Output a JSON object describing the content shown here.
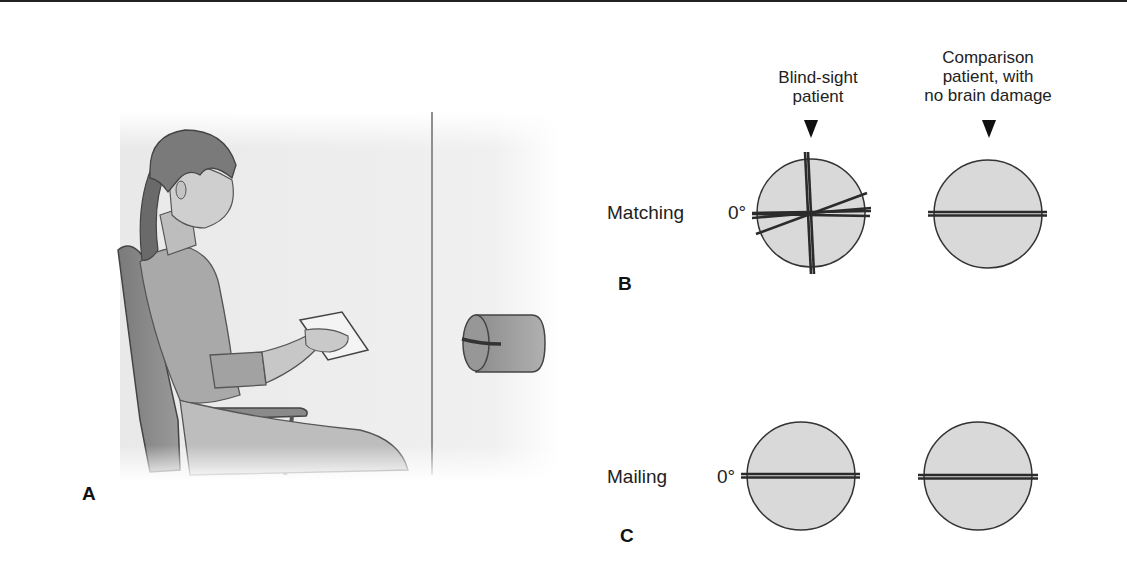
{
  "figure": {
    "panels": {
      "a": {
        "letter": "A"
      },
      "b": {
        "letter": "B",
        "row_label": "Matching",
        "zero_label": "0°"
      },
      "c": {
        "letter": "C",
        "row_label": "Mailing",
        "zero_label": "0°"
      }
    },
    "columns": [
      {
        "heading_line1": "Blind-sight",
        "heading_line2": "patient",
        "heading_line3": ""
      },
      {
        "heading_line1": "Comparison",
        "heading_line2": "patient, with",
        "heading_line3": "no brain damage"
      }
    ],
    "orientation_results": {
      "matching_blindsight_angles_deg": [
        -88,
        -86,
        -2,
        3,
        8,
        20
      ],
      "matching_comparison_angles_deg": [
        0,
        1
      ],
      "mailing_blindsight_angles_deg": [
        0,
        1
      ],
      "mailing_comparison_angles_deg": [
        0,
        1
      ]
    },
    "colors": {
      "disc_fill": "#d9d9d9",
      "line": "#2b2b2b",
      "scene_bg": "#ececec"
    }
  }
}
